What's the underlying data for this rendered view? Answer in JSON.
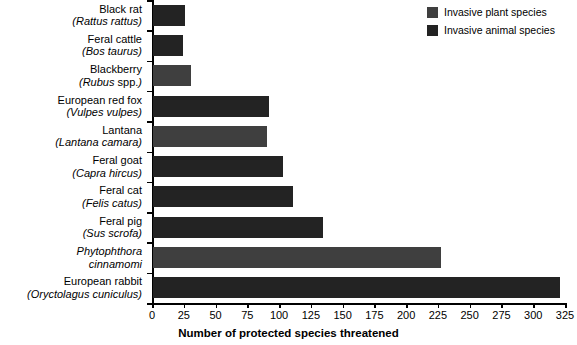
{
  "chart_data": {
    "type": "bar",
    "orientation": "horizontal",
    "title": "",
    "xlabel": "Number of protected species threatened",
    "ylabel": "",
    "xlim": [
      0,
      325
    ],
    "xticks": [
      0,
      25,
      50,
      75,
      100,
      125,
      150,
      175,
      200,
      225,
      250,
      275,
      300,
      325
    ],
    "grid": false,
    "legend_position": "top-right",
    "categories": [
      "Black rat (Rattus rattus)",
      "Feral cattle (Bos taurus)",
      "Blackberry (Rubus spp.)",
      "European red fox (Vulpes vulpes)",
      "Lantana (Lantana camara)",
      "Feral goat (Capra hircus)",
      "Feral cat (Felis catus)",
      "Feral pig (Sus scrofa)",
      "Phytophthora cinnamomi",
      "European rabbit (Oryctolagus cuniculus)"
    ],
    "values": [
      25,
      24,
      30,
      91,
      90,
      102,
      110,
      134,
      227,
      320
    ],
    "groups": [
      "animal",
      "animal",
      "plant",
      "animal",
      "plant",
      "animal",
      "animal",
      "animal",
      "plant",
      "animal"
    ],
    "series": [
      {
        "name": "Invasive plant species",
        "color": "#3f3f3f",
        "points": [
          {
            "category": "Blackberry (Rubus spp.)",
            "value": 30
          },
          {
            "category": "Lantana (Lantana camara)",
            "value": 90
          },
          {
            "category": "Phytophthora cinnamomi",
            "value": 227
          }
        ]
      },
      {
        "name": "Invasive animal species",
        "color": "#232323",
        "points": [
          {
            "category": "Black rat (Rattus rattus)",
            "value": 25
          },
          {
            "category": "Feral cattle (Bos taurus)",
            "value": 24
          },
          {
            "category": "European red fox (Vulpes vulpes)",
            "value": 91
          },
          {
            "category": "Feral goat (Capra hircus)",
            "value": 102
          },
          {
            "category": "Feral cat (Felis catus)",
            "value": 110
          },
          {
            "category": "Feral pig (Sus scrofa)",
            "value": 134
          },
          {
            "category": "European rabbit (Oryctolagus cuniculus)",
            "value": 320
          }
        ]
      }
    ]
  },
  "axis": {
    "x_title": "Number of protected species threatened",
    "tick_labels": [
      "0",
      "25",
      "50",
      "75",
      "100",
      "125",
      "150",
      "175",
      "200",
      "225",
      "250",
      "275",
      "300",
      "325"
    ]
  },
  "legend": {
    "items": [
      {
        "label": "Invasive plant species",
        "color": "#3f3f3f"
      },
      {
        "label": "Invasive animal species",
        "color": "#232323"
      }
    ]
  },
  "rows": [
    {
      "common": "Black rat",
      "sci_open": "(",
      "sci": "Rattus rattus",
      "sci_close": ")",
      "value": 25,
      "group": "animal"
    },
    {
      "common": "Feral cattle",
      "sci_open": "(",
      "sci": "Bos taurus",
      "sci_close": ")",
      "value": 24,
      "group": "animal"
    },
    {
      "common": "Blackberry",
      "sci_open": "(",
      "sci": "Rubus",
      "sci_roman": " spp.",
      "sci_close": ")",
      "value": 30,
      "group": "plant"
    },
    {
      "common": "European red fox",
      "sci_open": "(",
      "sci": "Vulpes vulpes",
      "sci_close": ")",
      "value": 91,
      "group": "animal"
    },
    {
      "common": "Lantana",
      "sci_open": "(",
      "sci": "Lantana camara",
      "sci_close": ")",
      "value": 90,
      "group": "plant"
    },
    {
      "common": "Feral goat",
      "sci_open": "(",
      "sci": "Capra hircus",
      "sci_close": ")",
      "value": 102,
      "group": "animal"
    },
    {
      "common": "Feral cat",
      "sci_open": "(",
      "sci": "Felis catus",
      "sci_close": ")",
      "value": 110,
      "group": "animal"
    },
    {
      "common": "Feral pig",
      "sci_open": "(",
      "sci": "Sus scrofa",
      "sci_close": ")",
      "value": 134,
      "group": "animal"
    },
    {
      "common": "Phytophthora",
      "sci_open": "",
      "sci": "cinnamomi",
      "sci_close": "",
      "value": 227,
      "group": "plant",
      "common_italic": true
    },
    {
      "common": "European rabbit",
      "sci_open": "(",
      "sci": "Oryctolagus cuniculus",
      "sci_close": ")",
      "value": 320,
      "group": "animal"
    }
  ],
  "colors": {
    "plant": "#3f3f3f",
    "animal": "#232323",
    "axis": "#000000",
    "background": "#ffffff"
  }
}
